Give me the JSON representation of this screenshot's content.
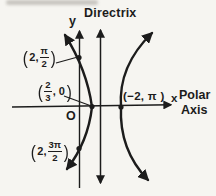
{
  "colors": {
    "ink": "#1c1c1c",
    "paper": "#f6f5f1"
  },
  "labels": {
    "directrix": "Directrix",
    "y_axis": "y",
    "x_axis": "x",
    "polar": "Polar",
    "axis": "Axis",
    "origin": "O"
  },
  "points": {
    "top": {
      "open": "(",
      "prefix": "2,",
      "numerator": "π",
      "denominator": "2",
      "close": ")"
    },
    "vertex": {
      "open": "(",
      "numerator": "2",
      "denominator": "3",
      "suffix": ", 0",
      "close": ")"
    },
    "right": {
      "text": "(−2, π )"
    },
    "bottom": {
      "open": "(",
      "prefix": "2,",
      "numerator": "3π",
      "denominator": "2",
      "close": ")"
    }
  },
  "icons": {
    "up_arrow": "axis-arrowhead-up",
    "down_arrow": "axis-arrowhead-down",
    "right_arrow": "axis-arrowhead-right"
  }
}
